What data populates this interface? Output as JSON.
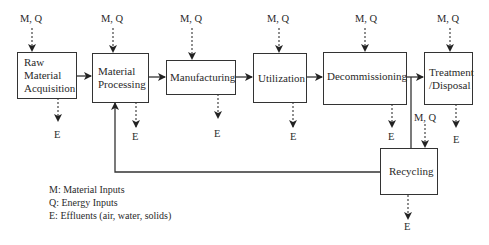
{
  "diagram": {
    "stages": [
      {
        "id": "raw",
        "label_lines": [
          "Raw",
          "Material",
          "Acquisition"
        ]
      },
      {
        "id": "processing",
        "label_lines": [
          "Material",
          "Processing"
        ]
      },
      {
        "id": "manufacturing",
        "label_lines": [
          "Manufacturing"
        ]
      },
      {
        "id": "utilization",
        "label_lines": [
          "Utilization"
        ]
      },
      {
        "id": "decommissioning",
        "label_lines": [
          "Decommissioning"
        ]
      },
      {
        "id": "treatment",
        "label_lines": [
          "Treatment",
          "/Disposal"
        ]
      },
      {
        "id": "recycling",
        "label_lines": [
          "Recycling"
        ]
      }
    ],
    "input_label": "M, Q",
    "output_label": "E",
    "legend": [
      "M: Material Inputs",
      "Q: Energy Inputs",
      "E: Effluents (air, water, solids)"
    ],
    "colors": {
      "line": "#333333",
      "background": "#ffffff"
    }
  }
}
